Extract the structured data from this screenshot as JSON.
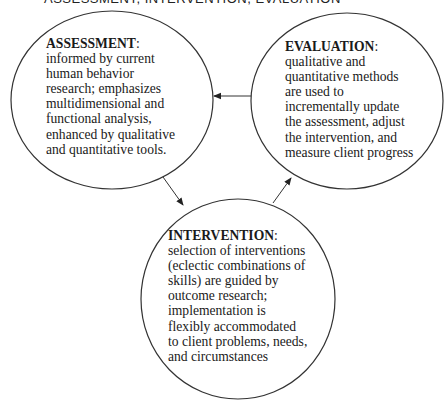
{
  "header": {
    "text": "ASSESSMENT, INTERVENTION, EVALUATION"
  },
  "colors": {
    "stroke": "#333333",
    "text": "#1a1a1a",
    "background": "#ffffff"
  },
  "nodes": {
    "assessment": {
      "title": "ASSESSMENT",
      "colon": ":",
      "lines": [
        "informed by current",
        "human behavior",
        "research; emphasizes",
        "multidimensional and",
        "functional analysis,",
        "enhanced by qualitative",
        "and quantitative tools."
      ]
    },
    "evaluation": {
      "title": "EVALUATION",
      "colon": ":",
      "lines": [
        "qualitative and",
        "quantitative methods",
        "are used to",
        "incrementally update",
        "the assessment, adjust",
        "the intervention, and",
        "measure client progress"
      ]
    },
    "intervention": {
      "title": "INTERVENTION",
      "colon": ":",
      "lines": [
        "selection of interventions",
        "(eclectic combinations of",
        "skills) are guided by",
        "outcome research;",
        "implementation is",
        "flexibly accommodated",
        "to client problems, needs,",
        "and circumstances"
      ]
    }
  },
  "edges": [
    {
      "from": "assessment",
      "to": "intervention"
    },
    {
      "from": "intervention",
      "to": "evaluation"
    },
    {
      "from": "evaluation",
      "to": "assessment"
    }
  ]
}
